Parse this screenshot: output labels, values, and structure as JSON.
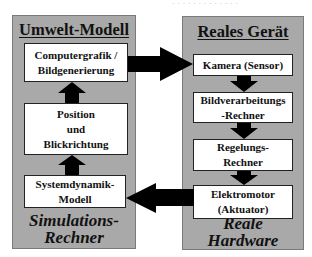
{
  "colors": {
    "panel_fill": "#a9a9a9",
    "box_fill": "#ffffff",
    "arrow_fill": "#000000"
  },
  "top_remnant": "· · · · · · · ·   · · · · ·",
  "left_panel": {
    "title": "Umwelt-Modell",
    "footer": "Simulations-\nRechner",
    "boxes": [
      {
        "label": "Computergrafik /\nBildgenerierung"
      },
      {
        "label": "Position\nund\nBlickrichtung"
      },
      {
        "label": "Systemdynamik-\nModell"
      }
    ]
  },
  "right_panel": {
    "title": "Reales Gerät",
    "footer": "Reale\nHardware",
    "boxes": [
      {
        "label": "Kamera (Sensor)"
      },
      {
        "label": "Bildverarbeitungs\n-Rechner"
      },
      {
        "label": "Regelungs-\nRechner"
      },
      {
        "label": "Elektromotor\n(Aktuator)"
      }
    ]
  },
  "arrows": [
    {
      "from": "Computergrafik / Bildgenerierung",
      "to": "Kamera (Sensor)",
      "direction": "right"
    },
    {
      "from": "Kamera (Sensor)",
      "to": "Bildverarbeitungs-Rechner",
      "direction": "down"
    },
    {
      "from": "Bildverarbeitungs-Rechner",
      "to": "Regelungs-Rechner",
      "direction": "down"
    },
    {
      "from": "Regelungs-Rechner",
      "to": "Elektromotor (Aktuator)",
      "direction": "down"
    },
    {
      "from": "Elektromotor (Aktuator)",
      "to": "Systemdynamik-Modell",
      "direction": "left"
    },
    {
      "from": "Systemdynamik-Modell",
      "to": "Position und Blickrichtung",
      "direction": "up"
    },
    {
      "from": "Position und Blickrichtung",
      "to": "Computergrafik / Bildgenerierung",
      "direction": "up"
    }
  ]
}
